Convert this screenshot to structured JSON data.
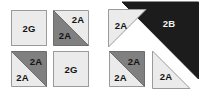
{
  "diagram": {
    "background_color": "#ffffff",
    "colors": {
      "light": "#ebebeb",
      "medium_gray": "#808080",
      "dark": "#1c1c1c",
      "outline": "#9a9a9a",
      "label_dark": "#141414",
      "label_light": "#f2f2f2"
    },
    "groups": [
      {
        "id": "left-group",
        "name": "four-patch-unit-group",
        "units": [
          {
            "id": "unit-tl",
            "name": "plain-square-2g",
            "shape": "square",
            "pieces": [
              {
                "label": "2G",
                "shade": "light",
                "position": "whole"
              }
            ]
          },
          {
            "id": "unit-tr",
            "name": "half-square-triangle-2a-2a",
            "shape": "half-square-triangle",
            "diagonal": "tl-br",
            "pieces": [
              {
                "label": "2A",
                "shade": "light",
                "position": "upper-right"
              },
              {
                "label": "2A",
                "shade": "medium_gray",
                "position": "lower-left"
              }
            ]
          },
          {
            "id": "unit-bl",
            "name": "half-square-triangle-2a-2a",
            "shape": "half-square-triangle",
            "diagonal": "bl-tr",
            "pieces": [
              {
                "label": "2A",
                "shade": "medium_gray",
                "position": "upper-right"
              },
              {
                "label": "2A",
                "shade": "light",
                "position": "lower-left"
              }
            ]
          },
          {
            "id": "unit-br",
            "name": "plain-square-2g",
            "shape": "square",
            "pieces": [
              {
                "label": "2G",
                "shade": "light",
                "position": "whole"
              }
            ]
          }
        ]
      },
      {
        "id": "right-group",
        "name": "large-triangle-unit-group",
        "units": [
          {
            "id": "unit-big-2b",
            "name": "large-dark-triangle-2b",
            "shape": "triangle",
            "right_angle": "top-right",
            "pieces": [
              {
                "label": "2B",
                "shade": "dark",
                "position": "whole"
              }
            ]
          },
          {
            "id": "unit-tri-tl",
            "name": "corner-triangle-2a",
            "shape": "triangle",
            "right_angle": "top-left",
            "pieces": [
              {
                "label": "2A",
                "shade": "light",
                "position": "whole"
              }
            ]
          },
          {
            "id": "unit-hst-bl",
            "name": "half-square-triangle-2a-2a",
            "shape": "half-square-triangle",
            "diagonal": "bl-tr",
            "pieces": [
              {
                "label": "2A",
                "shade": "medium_gray",
                "position": "upper-right"
              },
              {
                "label": "2A",
                "shade": "light",
                "position": "lower-left"
              }
            ]
          },
          {
            "id": "unit-tri-br",
            "name": "corner-triangle-2a",
            "shape": "triangle",
            "right_angle": "bottom-left",
            "pieces": [
              {
                "label": "2A",
                "shade": "light",
                "position": "whole"
              }
            ]
          }
        ]
      }
    ]
  }
}
